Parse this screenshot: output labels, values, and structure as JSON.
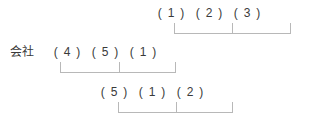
{
  "diagram": {
    "type": "cascade-ngram-alignment",
    "label": "会社",
    "paren_open": "(",
    "paren_close": ")",
    "rows": [
      {
        "id": "top",
        "name": "row-top",
        "label": "",
        "cells": [
          "1",
          "2",
          "3"
        ]
      },
      {
        "id": "middle",
        "name": "row-middle",
        "label": "会社",
        "cells": [
          "4",
          "5",
          "1"
        ]
      },
      {
        "id": "bottom",
        "name": "row-bottom",
        "label": "",
        "cells": [
          "5",
          "1",
          "2"
        ]
      }
    ],
    "brackets": [
      {
        "id": "top",
        "spans": [
          "1",
          "2",
          "3"
        ]
      },
      {
        "id": "middle",
        "spans": [
          "4",
          "5",
          "1"
        ]
      },
      {
        "id": "bottom",
        "spans": [
          "5",
          "1",
          "2"
        ]
      }
    ]
  },
  "colors": {
    "text": "#3a3a3a",
    "bracket": "#b8b8b8",
    "background": "#ffffff"
  }
}
